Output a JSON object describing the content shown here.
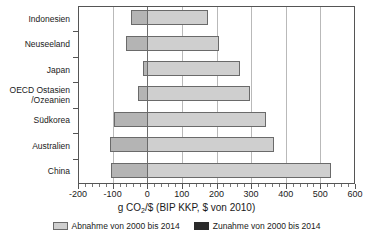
{
  "chart_data": {
    "type": "bar",
    "orientation": "horizontal",
    "title": "",
    "xlabel": "g CO2/$ (BIP KKP, $ von 2010)",
    "xlabel_parts": {
      "pre": "g CO",
      "sub": "2",
      "post": "/$ (BIP KKP, $ von 2010)"
    },
    "ylabel": "",
    "xlim": [
      -200,
      600
    ],
    "xticks": [
      -200,
      -100,
      0,
      100,
      200,
      300,
      400,
      500,
      600
    ],
    "xticklabels": [
      "-200",
      "-100",
      "0",
      "100",
      "200",
      "300",
      "400",
      "500",
      "600"
    ],
    "minor_tick_step": 20,
    "grid": true,
    "grid_axis": "x",
    "zero_line": 0,
    "categories": [
      "Indonesien",
      "Neuseeland",
      "Japan",
      "OECD Ostasien /Ozeanien",
      "Südkorea",
      "Australien",
      "China"
    ],
    "category_lines": [
      [
        "Indonesien"
      ],
      [
        "Neuseeland"
      ],
      [
        "Japan"
      ],
      [
        "OECD Ostasien",
        "/Ozeanien"
      ],
      [
        "Südkorea"
      ],
      [
        "Australien"
      ],
      [
        "China"
      ]
    ],
    "series": [
      {
        "name": "Abnahme von 2000 bis 2014",
        "color": "#cfcfcf",
        "values": [
          175,
          208,
          268,
          298,
          344,
          367,
          532
        ]
      },
      {
        "name": "Zunahme von 2000 bis 2014",
        "color": "#2b2b2b",
        "values": [
          -48,
          -62,
          -13,
          -28,
          -96,
          -108,
          -106
        ]
      }
    ],
    "bars": [
      {
        "category": "Indonesien",
        "negative": -48,
        "positive": 175
      },
      {
        "category": "Neuseeland",
        "negative": -62,
        "positive": 208
      },
      {
        "category": "Japan",
        "negative": -13,
        "positive": 268
      },
      {
        "category": "OECD Ostasien /Ozeanien",
        "negative": -28,
        "positive": 298
      },
      {
        "category": "Südkorea",
        "negative": -96,
        "positive": 344
      },
      {
        "category": "Australien",
        "negative": -108,
        "positive": 367
      },
      {
        "category": "China",
        "negative": -106,
        "positive": 532
      }
    ],
    "legend": {
      "position": "bottom",
      "entries": [
        {
          "label": "Abnahme von 2000 bis 2014",
          "swatch": "decrease"
        },
        {
          "label": "Zunahme von 2000 bis 2014",
          "swatch": "increase"
        }
      ]
    },
    "colors": {
      "positive_segment": "#cfcfcf",
      "negative_segment": "#b4b4b4",
      "bar_border": "#6a6a6a",
      "grid": "#b9b9b9",
      "zero_line": "#6e6e6e",
      "axis": "#555555",
      "text": "#1a1a1a",
      "background": "#ffffff"
    }
  }
}
